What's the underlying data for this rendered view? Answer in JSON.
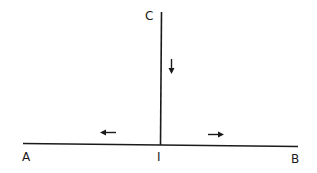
{
  "diagram": {
    "labels": {
      "c": "C",
      "a": "A",
      "i": "I",
      "b": "B"
    },
    "arrows": {
      "vertical": "down",
      "left": "left",
      "right": "right"
    },
    "colors": {
      "line": "#1a1a1a",
      "background": "#ffffff"
    }
  }
}
